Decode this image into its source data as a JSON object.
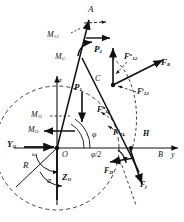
{
  "figure": {
    "type": "free-body-force-diagram",
    "background": "#ffffff",
    "stroke": "#111111"
  },
  "axes": {
    "y_axis_label": "y",
    "z_axis_label": "z",
    "origin_label": "O",
    "y_zero_label": "Y",
    "y_zero_sub": "O",
    "z_zero_label": "Z",
    "z_zero_sub": "O"
  },
  "points": {
    "a": "A",
    "c": "C",
    "h": "H",
    "b": "B",
    "o": "O"
  },
  "angles": {
    "phi": "φ",
    "phi_half": "φ/2",
    "alpha": "α",
    "omega": "ω"
  },
  "radius": {
    "label": "R"
  },
  "forces": [
    {
      "name": "F",
      "sub": "R",
      "sup": ""
    },
    {
      "name": "F",
      "sub": "12",
      "sup": "n"
    },
    {
      "name": "F",
      "sub": "12",
      "sup": "t"
    },
    {
      "name": "F",
      "sub": "11",
      "sup": "n"
    },
    {
      "name": "F",
      "sub": "11",
      "sup": "t"
    },
    {
      "name": "F",
      "sub": "H",
      "sup": ""
    },
    {
      "name": "F",
      "sub": "j",
      "sup": ""
    }
  ],
  "loads": [
    {
      "name": "P",
      "sub": "1"
    },
    {
      "name": "P",
      "sub": "2"
    }
  ],
  "moments": [
    {
      "name": "M",
      "sub": "12"
    },
    {
      "name": "M",
      "sub": "C"
    },
    {
      "name": "M",
      "sub": "11"
    },
    {
      "name": "M",
      "sub": "O"
    }
  ],
  "labels": {
    "M12": "M",
    "M12_sub": "12",
    "MC": "M",
    "MC_sub": "C",
    "M11": "M",
    "M11_sub": "11",
    "MO": "M",
    "MO_sub": "O",
    "P1": "P",
    "P1_sub": "1",
    "P2": "P",
    "P2_sub": "2",
    "FR": "F",
    "FR_sub": "R",
    "F12n": "F",
    "F12n_sub": "12",
    "F12n_sup": "n",
    "F12t": "F",
    "F12t_sub": "12",
    "F12t_sup": "t",
    "F11n": "F",
    "F11n_sub": "11",
    "F11n_sup": "n",
    "F11t": "F",
    "F11t_sub": "11",
    "F11t_sup": "t",
    "FH": "F",
    "FH_sub": "H",
    "Fj": "F",
    "Fj_sub": "j"
  }
}
